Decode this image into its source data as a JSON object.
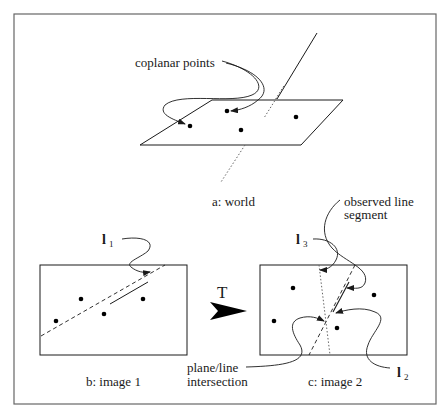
{
  "figure": {
    "frame": {
      "stroke": "#555555"
    },
    "panels": {
      "world": {
        "caption": "a: world",
        "annotation": "coplanar points",
        "plane_points": 4
      },
      "image1": {
        "caption": "b: image 1",
        "line_label": "l",
        "line_label_sub": "1",
        "points": 4
      },
      "image2": {
        "caption": "c: image 2",
        "line_label_3": "l",
        "line_label_3_sub": "3",
        "line_label_2": "l",
        "line_label_2_sub": "2",
        "annotation_segment_line1": "observed line",
        "annotation_segment_line2": "segment",
        "annotation_intersection_line1": "plane/line",
        "annotation_intersection_line2": "intersection",
        "points": 4
      }
    },
    "transform": {
      "label": "T",
      "icon": "arrow-right-icon"
    },
    "colors": {
      "ink": "#1a1a1a",
      "dotted": "#666666"
    }
  }
}
